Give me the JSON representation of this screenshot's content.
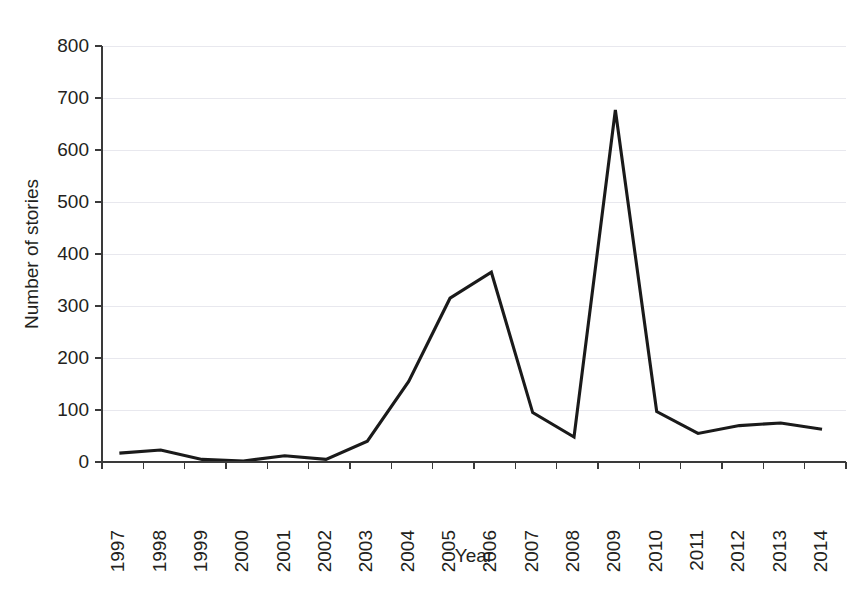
{
  "chart_data": {
    "type": "line",
    "title": "",
    "subtitle": "",
    "xlabel": "Year",
    "ylabel": "Number of stories",
    "categories": [
      "1997",
      "1998",
      "1999",
      "2000",
      "2001",
      "2002",
      "2003",
      "2004",
      "2005",
      "2006",
      "2007",
      "2008",
      "2009",
      "2010",
      "2011",
      "2012",
      "2013",
      "2014"
    ],
    "x": [
      1997,
      1998,
      1999,
      2000,
      2001,
      2002,
      2003,
      2004,
      2005,
      2006,
      2007,
      2008,
      2009,
      2010,
      2011,
      2012,
      2013,
      2014
    ],
    "values": [
      17,
      23,
      5,
      2,
      12,
      5,
      40,
      155,
      315,
      365,
      95,
      48,
      677,
      97,
      55,
      70,
      75,
      63
    ],
    "series": [
      {
        "name": "Number of stories",
        "values": [
          17,
          23,
          5,
          2,
          12,
          5,
          40,
          155,
          315,
          365,
          95,
          48,
          677,
          97,
          55,
          70,
          75,
          63
        ]
      }
    ],
    "ylim": [
      0,
      800
    ],
    "ytick_labels": [
      "0",
      "100",
      "200",
      "300",
      "400",
      "500",
      "600",
      "700",
      "800"
    ],
    "ytick_values": [
      0,
      100,
      200,
      300,
      400,
      500,
      600,
      700,
      800
    ],
    "xtick_labels": [
      "1997",
      "1998",
      "1999",
      "2000",
      "2001",
      "2002",
      "2003",
      "2004",
      "2005",
      "2006",
      "2007",
      "2008",
      "2009",
      "2010",
      "2011",
      "2012",
      "2013",
      "2014"
    ],
    "xtick_rotation": 90,
    "grid": "horizontal",
    "legend": "none",
    "line_color": "#1a1a1a",
    "grid_color": "#e8e8ee",
    "axis_color": "#3a3a3a",
    "annotations": []
  },
  "figure": {
    "background": "#ffffff",
    "ylabel_text": "Number of stories",
    "xlabel_text": "Year"
  }
}
